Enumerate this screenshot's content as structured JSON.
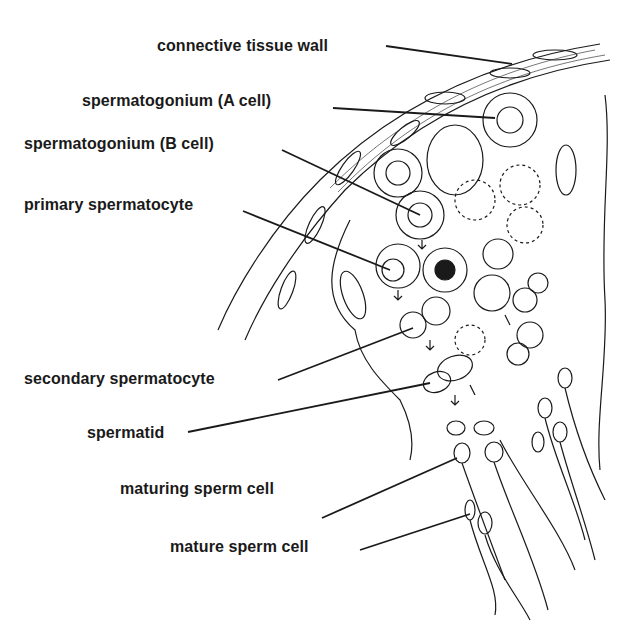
{
  "diagram": {
    "labels": [
      {
        "id": "connective-tissue-wall",
        "text": "connective tissue wall",
        "x": 157,
        "y": 37
      },
      {
        "id": "spermatogonium-a",
        "text": "spermatogonium (A cell)",
        "x": 82,
        "y": 92
      },
      {
        "id": "spermatogonium-b",
        "text": "spermatogonium (B cell)",
        "x": 24,
        "y": 135
      },
      {
        "id": "primary-spermatocyte",
        "text": "primary spermatocyte",
        "x": 24,
        "y": 196
      },
      {
        "id": "secondary-spermatocyte",
        "text": "secondary spermatocyte",
        "x": 24,
        "y": 370
      },
      {
        "id": "spermatid",
        "text": "spermatid",
        "x": 87,
        "y": 424
      },
      {
        "id": "maturing-sperm-cell",
        "text": "maturing sperm cell",
        "x": 120,
        "y": 480
      },
      {
        "id": "mature-sperm-cell",
        "text": "mature sperm cell",
        "x": 170,
        "y": 538
      }
    ],
    "colors": {
      "line": "#1a1a1a",
      "background": "#ffffff"
    }
  }
}
